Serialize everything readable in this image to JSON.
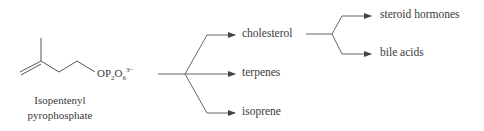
{
  "molecule": {
    "formula_prefix": "OP",
    "formula_sub1": "2",
    "formula_mid": "O",
    "formula_sub2": "6",
    "formula_charge": "3−",
    "name_line1": "Isopentenyl",
    "name_line2": "pyrophosphate"
  },
  "products": {
    "first_level": [
      "cholesterol",
      "terpenes",
      "isoprene"
    ],
    "cholesterol_derivatives": [
      "steroid hormones",
      "bile acids"
    ]
  },
  "colors": {
    "line": "#555555",
    "text": "#3a3a3a"
  }
}
